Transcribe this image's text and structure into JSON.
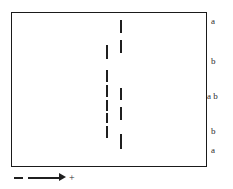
{
  "figure": {
    "background_color": "#ffffff",
    "frame": {
      "border_color": "#1a1a1a",
      "x": 11,
      "y": 12,
      "width": 196,
      "height": 155
    },
    "line_color": "#1f1f1f",
    "dashed_lines": [
      {
        "name": "right-dashed-line",
        "x": 120,
        "segments": [
          {
            "top": 20,
            "height": 13
          },
          {
            "top": 40,
            "height": 13
          },
          {
            "top": 88,
            "height": 12
          },
          {
            "top": 107,
            "height": 13
          },
          {
            "top": 134,
            "height": 15
          }
        ]
      },
      {
        "name": "left-dashed-line",
        "x": 106,
        "segments": [
          {
            "top": 45,
            "height": 14
          },
          {
            "top": 70,
            "height": 12
          },
          {
            "top": 85,
            "height": 12
          },
          {
            "top": 100,
            "height": 11
          },
          {
            "top": 113,
            "height": 10
          },
          {
            "top": 126,
            "height": 12
          }
        ]
      }
    ],
    "side_labels": [
      {
        "text": "a",
        "x": 211,
        "y": 17
      },
      {
        "text": "b",
        "x": 211,
        "y": 57
      },
      {
        "text": "a b",
        "x": 207,
        "y": 92
      },
      {
        "text": "b",
        "x": 211,
        "y": 127
      },
      {
        "text": "a",
        "x": 211,
        "y": 146
      }
    ],
    "legend": {
      "dash_symbol": "dashed-segment",
      "arrow_symbol": "right-arrow",
      "label": "+"
    }
  },
  "chart_data": {
    "type": "diagram",
    "title": "",
    "xlabel": "",
    "ylabel": "",
    "annotations": [
      "a",
      "b",
      "a b",
      "b",
      "a",
      "+"
    ]
  }
}
